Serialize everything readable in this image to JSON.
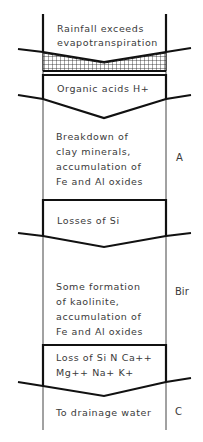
{
  "diagram": {
    "blocks": [
      {
        "lines": [
          "Rainfall exceeds",
          "evapotranspiration"
        ]
      },
      {
        "lines": [
          "Organic acids  H+"
        ]
      },
      {
        "lines": [
          "Breakdown  of",
          "clay  minerals,",
          "accumulation  of",
          "Fe  and  Al oxides"
        ]
      },
      {
        "lines": [
          "Losses  of  Si"
        ]
      },
      {
        "lines": [
          "Some  formation",
          "of  kaolinite,",
          "accumulation  of",
          "Fe  and  Al  oxides"
        ]
      },
      {
        "lines": [
          "Loss  of Si  N  Ca++",
          "Mg++  Na+  K+"
        ]
      },
      {
        "lines": [
          "To  drainage  water"
        ]
      }
    ],
    "horizon_labels": {
      "A": "A",
      "Bir": "Bir",
      "C": "C"
    }
  }
}
